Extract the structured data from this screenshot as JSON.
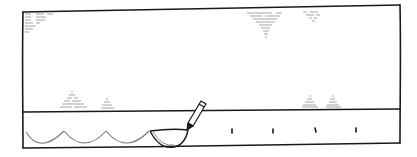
{
  "panel": {
    "description": "hand-drawn comic panel",
    "colors": {
      "ink": "#1a1a1a",
      "faint_ink": "#9a9a9a",
      "background": "#ffffff"
    }
  },
  "frame": {
    "top_left": [
      23,
      12
    ],
    "top_right": [
      400,
      5
    ],
    "bottom_left": [
      23,
      148
    ],
    "bottom_right": [
      400,
      143
    ],
    "divider_left_y": 112,
    "divider_right_y": 109
  },
  "scribbles": [
    {
      "name": "top-left-scribble-block",
      "x": 25,
      "y": 12,
      "rows": 7
    },
    {
      "name": "top-center-inverted-triangle",
      "x": 250,
      "y": 13,
      "rows": 8
    },
    {
      "name": "top-right-small-triangle",
      "x": 305,
      "y": 12,
      "rows": 4
    },
    {
      "name": "left-pyramid-large",
      "x": 62,
      "y": 92,
      "rows": 5
    },
    {
      "name": "left-pyramid-small",
      "x": 100,
      "y": 98,
      "rows": 3
    },
    {
      "name": "right-pyramid-1",
      "x": 303,
      "y": 95,
      "rows": 4
    },
    {
      "name": "right-pyramid-2",
      "x": 328,
      "y": 95,
      "rows": 4
    }
  ],
  "arches": {
    "count": 4,
    "start_x": 26,
    "period": 41,
    "baseline_y": 148,
    "peak_y": 131
  },
  "bowl": {
    "cx": 174,
    "rim_y": 131,
    "half_width": 24,
    "depth": 16
  },
  "pencil": {
    "tip": [
      186,
      128
    ],
    "end": [
      205,
      101
    ]
  },
  "ticks": {
    "x": [
      232,
      273,
      315,
      356
    ],
    "y1": 128,
    "y2": 133
  }
}
